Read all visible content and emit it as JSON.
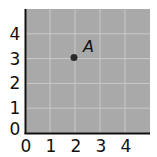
{
  "chart_data": {
    "type": "scatter",
    "title": "",
    "xlabel": "",
    "ylabel": "",
    "xlim": [
      0,
      5
    ],
    "ylim": [
      0,
      5
    ],
    "x_ticks": [
      "0",
      "1",
      "2",
      "3",
      "4"
    ],
    "y_ticks": [
      "0",
      "1",
      "2",
      "3",
      "4"
    ],
    "grid": true,
    "legend": null,
    "points": [
      {
        "label": "A",
        "x": 2,
        "y": 3
      }
    ]
  },
  "style": {
    "plot_bg": "#a9a9a9",
    "grid_color": "#c9c9c9",
    "axis_color": "#111111",
    "point_color": "#2a2a2a"
  }
}
